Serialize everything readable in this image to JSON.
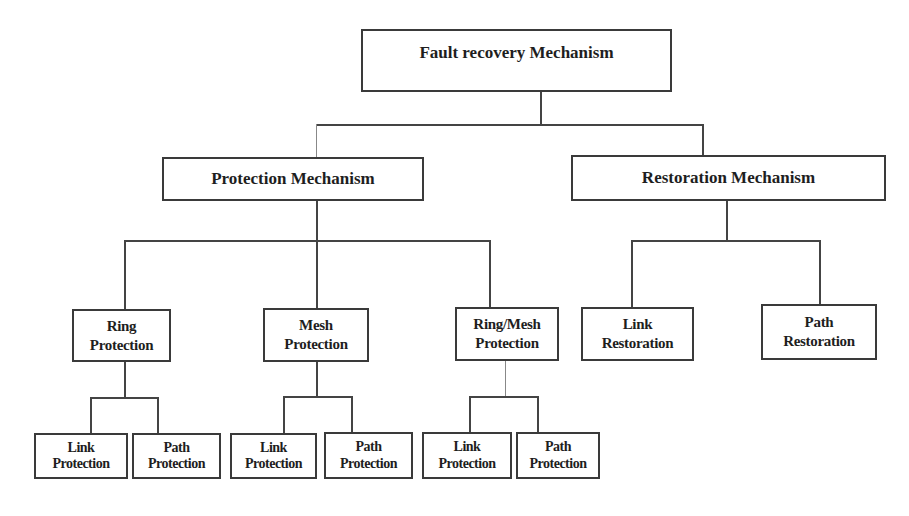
{
  "diagram": {
    "title": "Fault recovery Mechanism",
    "level1": [
      {
        "label": "Protection Mechanism"
      },
      {
        "label": "Restoration Mechanism"
      }
    ],
    "protection_children": [
      {
        "line1": "Ring",
        "line2": "Protection",
        "children": [
          {
            "line1": "Link",
            "line2": "Protection"
          },
          {
            "line1": "Path",
            "line2": "Protection"
          }
        ]
      },
      {
        "line1": "Mesh",
        "line2": "Protection",
        "children": [
          {
            "line1": "Link",
            "line2": "Protection"
          },
          {
            "line1": "Path",
            "line2": "Protection"
          }
        ]
      },
      {
        "line1": "Ring/Mesh",
        "line2": "Protection",
        "children": [
          {
            "line1": "Link",
            "line2": "Protection"
          },
          {
            "line1": "Path",
            "line2": "Protection"
          }
        ]
      }
    ],
    "restoration_children": [
      {
        "line1": "Link",
        "line2": "Restoration"
      },
      {
        "line1": "Path",
        "line2": "Restoration"
      }
    ],
    "colors": {
      "line": "#444444",
      "border": "#3a3a3a",
      "text": "#1e1e1e",
      "background": "#ffffff"
    }
  }
}
